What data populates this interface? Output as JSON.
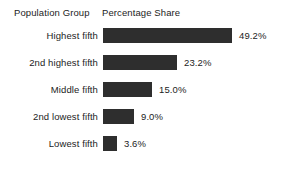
{
  "header": {
    "group_column_label": "Population Group",
    "share_column_label": "Percentage Share"
  },
  "chart_data": {
    "type": "bar",
    "orientation": "horizontal",
    "title": "",
    "subtitle": "",
    "xlabel": "Percentage Share",
    "ylabel": "Population Group",
    "categories": [
      "Highest fifth",
      "2nd highest fifth",
      "Middle fifth",
      "2nd lowest fifth",
      "Lowest fifth"
    ],
    "values": [
      49.2,
      23.2,
      15.0,
      9.0,
      3.6
    ],
    "value_labels": [
      "49.2%",
      "23.2%",
      "15.0%",
      "9.0%",
      "3.6%"
    ],
    "xlim": [
      0,
      49.2
    ],
    "grid": false,
    "legend": false,
    "bar_color": "#2e2e2e",
    "background_color": "#ffffff",
    "rows": [
      {
        "label": "Highest fifth",
        "value": 49.2,
        "value_label": "49.2%",
        "bar_px": 129
      },
      {
        "label": "2nd highest fifth",
        "value": 23.2,
        "value_label": "23.2%",
        "bar_px": 74
      },
      {
        "label": "Middle fifth",
        "value": 15.0,
        "value_label": "15.0%",
        "bar_px": 49
      },
      {
        "label": "2nd lowest fifth",
        "value": 9.0,
        "value_label": "9.0%",
        "bar_px": 31
      },
      {
        "label": "Lowest fifth",
        "value": 3.6,
        "value_label": "3.6%",
        "bar_px": 14
      }
    ]
  }
}
